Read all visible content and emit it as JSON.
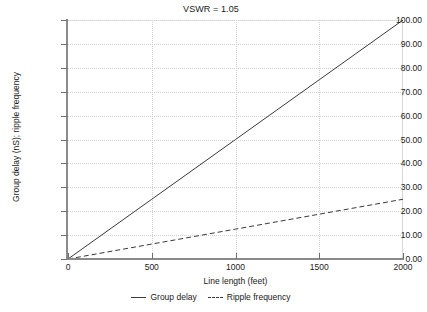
{
  "chart_data": {
    "type": "line",
    "title": "VSWR = 1.05",
    "xlabel": "Line length (feet)",
    "ylabel": "Group delay (nS); ripple frequency",
    "xlim": [
      0,
      2000
    ],
    "ylim": [
      0,
      100
    ],
    "grid": true,
    "legend_position": "bottom",
    "xticks": [
      0,
      500,
      1000,
      1500,
      2000
    ],
    "xtick_labels": [
      "0",
      "500",
      "1000",
      "1500",
      "2000"
    ],
    "yticks": [
      0,
      10,
      20,
      30,
      40,
      50,
      60,
      70,
      80,
      90,
      100
    ],
    "ytick_labels": [
      "0.00",
      "10.00",
      "20.00",
      "30.00",
      "40.00",
      "50.00",
      "60.00",
      "70.00",
      "80.00",
      "90.00",
      "100.00"
    ],
    "x": [
      0,
      500,
      1000,
      1500,
      2000
    ],
    "series": [
      {
        "name": "Group delay",
        "style": "solid",
        "color": "#3a3a3a",
        "values": [
          0.0,
          25.0,
          50.0,
          75.0,
          100.0
        ]
      },
      {
        "name": "Ripple frequency",
        "style": "dashed",
        "color": "#3a3a3a",
        "values": [
          0.0,
          6.25,
          12.5,
          18.75,
          25.0
        ]
      }
    ]
  },
  "legend": {
    "entries": [
      {
        "label": "Group delay"
      },
      {
        "label": "Ripple frequency"
      }
    ]
  },
  "colors": {
    "grid": "#d2d2d2",
    "axis": "#8a8a8a",
    "line": "#3a3a3a",
    "text": "#1a1a1a",
    "background": "#ffffff"
  }
}
